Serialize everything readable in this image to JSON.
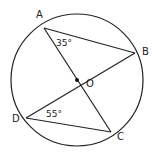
{
  "diagram": {
    "circle": {
      "cx": 77,
      "cy": 80,
      "r": 66
    },
    "center": {
      "label": "O",
      "x": 77,
      "y": 80
    },
    "points": [
      {
        "label": "A",
        "x": 44,
        "y": 28
      },
      {
        "label": "B",
        "x": 135,
        "y": 53
      },
      {
        "label": "C",
        "x": 111,
        "y": 132
      },
      {
        "label": "D",
        "x": 26,
        "y": 118
      }
    ],
    "segments": [
      "AC",
      "BD",
      "AB",
      "DC"
    ],
    "angles": [
      {
        "vertex": "A",
        "label": "35°"
      },
      {
        "vertex": "D",
        "label": "55°"
      }
    ]
  }
}
